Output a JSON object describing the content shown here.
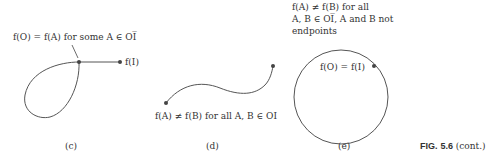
{
  "panels": [
    {
      "id": "c",
      "caption": "(c)",
      "annotation": "f(O) = f(A) for some A ∈ OI̅",
      "endpoint_label": "f(I)"
    },
    {
      "id": "d",
      "caption": "(d)",
      "annotation": "f(A) ≠ f(B) for all A, B ∈ OI"
    },
    {
      "id": "e",
      "caption": "(e)",
      "annotation_lines": [
        "f(A) ≠ f(B) for all",
        "A, B ∈ OI̅, A and B not",
        "endpoints"
      ],
      "point_label": "f(O) = f(I)"
    }
  ],
  "figure": {
    "label": "FIG.",
    "number": "5.6",
    "suffix": "(cont.)"
  }
}
